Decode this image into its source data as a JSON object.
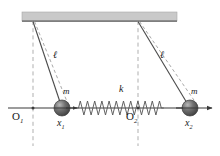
{
  "figure": {
    "kind": "physics-diagram",
    "colors": {
      "ceiling_fill": "#c9c9c9",
      "ceiling_edge": "#8e8e8e",
      "line": "#3a3a3a",
      "dashed": "#9a9a9a",
      "mass_dark": "#4a4a4a",
      "mass_light": "#b8b8b8",
      "spring": "#5a5a5a",
      "text": "#1a1a1a"
    }
  },
  "labels": {
    "length_left": "ℓ",
    "length_right": "ℓ",
    "mass_left": "m",
    "mass_right": "m",
    "spring_constant": "k",
    "origin_left": "O",
    "origin_left_sub": "1",
    "origin_right": "O",
    "origin_right_sub": "2",
    "coord_left": "x",
    "coord_left_sub": "1",
    "coord_right": "x",
    "coord_right_sub": "2"
  },
  "geometry": {
    "ceiling": {
      "x": 22,
      "y": 12,
      "width": 155,
      "height": 9
    },
    "pivot_left": {
      "x": 33,
      "y": 21
    },
    "pivot_right": {
      "x": 138,
      "y": 21
    },
    "mass_left": {
      "x": 62,
      "y": 108,
      "r": 8
    },
    "mass_right": {
      "x": 190,
      "y": 108,
      "r": 8
    },
    "axis": {
      "x1": 8,
      "x2": 213,
      "y": 108
    },
    "origin_left_point": {
      "x": 33,
      "y": 108
    },
    "origin_right_point": {
      "x": 138,
      "y": 108
    },
    "spring": {
      "x1": 76,
      "x2": 176,
      "y": 108,
      "coils": 14
    }
  }
}
